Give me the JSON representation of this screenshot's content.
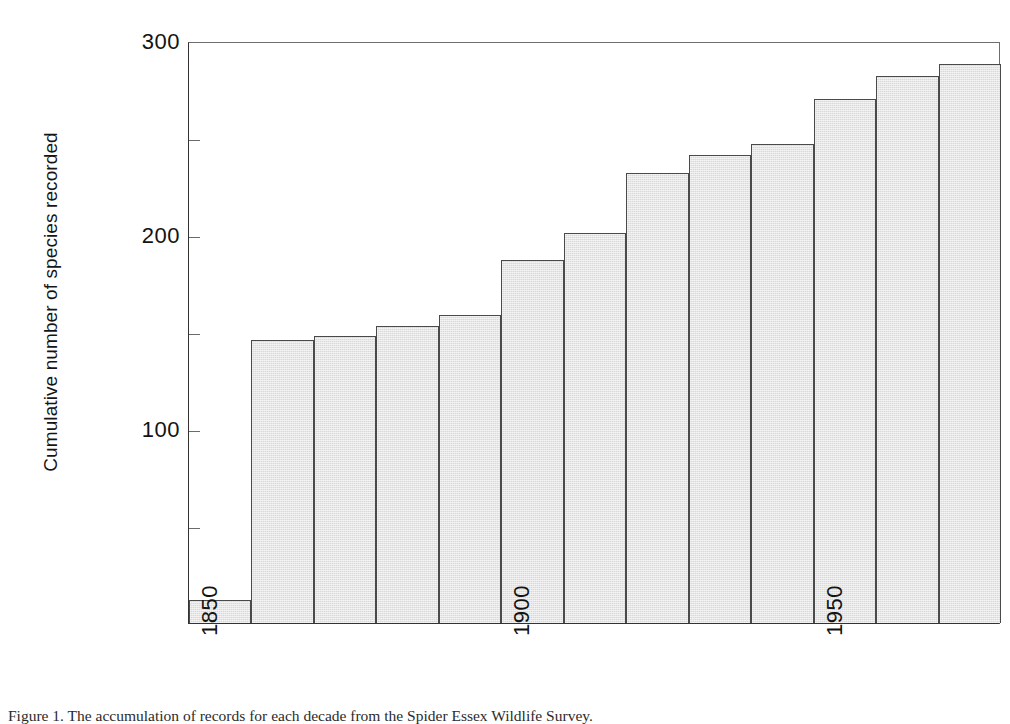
{
  "figure": {
    "caption_label": "Figure 1.",
    "caption_text": "The accumulation of records for each decade from the Spider Essex Wildlife Survey.",
    "caption_full": "Figure 1. The accumulation of records for each decade from the Spider Essex Wildlife Survey."
  },
  "chart_data": {
    "type": "bar",
    "title": "",
    "subtitle": "",
    "xlabel": "",
    "ylabel": "Cumulative number of species recorded",
    "xlim": [
      1850,
      1980
    ],
    "ylim": [
      0,
      300
    ],
    "grid": false,
    "legend": null,
    "y_major_ticks": [
      100,
      200,
      300
    ],
    "y_minor_ticks": [
      50,
      150,
      250
    ],
    "y_tick_labels": [
      "100",
      "200",
      "300"
    ],
    "x_tick_values": [
      1850,
      1900,
      1950
    ],
    "x_tick_labels": [
      "1850",
      "1900",
      "1950"
    ],
    "x_label_rotation": 90,
    "bar_width_years": 10,
    "bar_fill_color": "#d9d9d9",
    "bar_edge_color": "#4a4a4a",
    "categories": [
      "1850",
      "1860",
      "1870",
      "1880",
      "1890",
      "1900",
      "1910",
      "1920",
      "1930",
      "1940",
      "1950",
      "1960",
      "1970"
    ],
    "x": [
      1850,
      1860,
      1870,
      1880,
      1890,
      1900,
      1910,
      1920,
      1930,
      1940,
      1950,
      1960,
      1970
    ],
    "values": [
      12,
      146,
      148,
      153,
      159,
      187,
      201,
      232,
      241,
      247,
      270,
      282,
      288
    ],
    "series": [
      {
        "name": "Cumulative species recorded",
        "values": [
          12,
          146,
          148,
          153,
          159,
          187,
          201,
          232,
          241,
          247,
          270,
          282,
          288
        ]
      }
    ]
  }
}
